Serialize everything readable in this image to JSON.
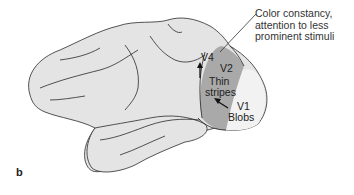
{
  "figure": {
    "panel_label": "b",
    "annotation": {
      "line1": "Color constancy,",
      "line2": "attention to less",
      "line3": "prominent stimuli"
    },
    "areas": {
      "v4": "V4",
      "v2": "V2",
      "v1": "V1"
    },
    "structures": {
      "thin_stripes_1": "Thin",
      "thin_stripes_2": "stripes",
      "blobs": "Blobs"
    },
    "colors": {
      "cortex": "#e4e4e4",
      "v2_region": "#a9a9a9",
      "v1_region": "#f0f0f0",
      "outline": "#2a2a2a"
    }
  }
}
